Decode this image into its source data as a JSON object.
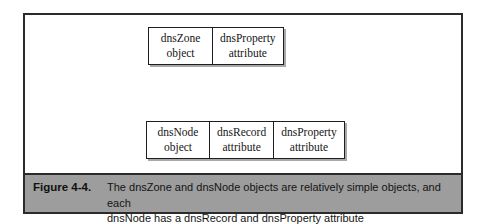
{
  "figure": {
    "label": "Figure 4-4.",
    "caption_lines": [
      "The dnsZone and dnsNode objects are relatively simple objects, and each",
      "dnsNode has a dnsRecord and dnsProperty attribute"
    ],
    "colors": {
      "frame_border": "#2b2b2b",
      "caption_band": "#9d9d9d",
      "box_border": "#1e1e1e",
      "box_shadow": "#a8a8a8",
      "page_background": "#ffffff"
    }
  },
  "diagram": {
    "type": "object-attribute-boxes",
    "rows": [
      {
        "id": "dnszone-row",
        "cells": [
          {
            "name": "dnsZone",
            "kind": "object"
          },
          {
            "name": "dnsProperty",
            "kind": "attribute"
          }
        ]
      },
      {
        "id": "dnsnode-row",
        "cells": [
          {
            "name": "dnsNode",
            "kind": "object"
          },
          {
            "name": "dnsRecord",
            "kind": "attribute"
          },
          {
            "name": "dnsProperty",
            "kind": "attribute"
          }
        ]
      }
    ]
  }
}
